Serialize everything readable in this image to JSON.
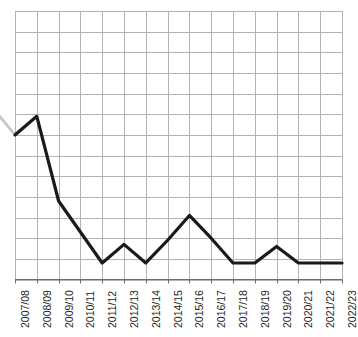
{
  "chart_data": {
    "type": "line",
    "title": "",
    "subtitle": "",
    "xlabel": "",
    "ylabel": "",
    "categories": [
      "2007/08",
      "2008/09",
      "2009/10",
      "2010/11",
      "2011/12",
      "2012/13",
      "2013/14",
      "2014/15",
      "2015/16",
      "2016/17",
      "2017/18",
      "2018/19",
      "2019/20",
      "2020/21",
      "2021/22",
      "2022/23"
    ],
    "series": [
      {
        "name": "series-1",
        "color": "#1a1a1a",
        "values": [
          7.0,
          7.9,
          3.8,
          2.3,
          0.8,
          1.7,
          0.8,
          1.9,
          3.1,
          2.0,
          0.8,
          0.8,
          1.6,
          0.8,
          0.8,
          0.8
        ]
      }
    ],
    "lead_in_segment": {
      "name": "prior-period-extension",
      "color": "#c8c8c8",
      "from": {
        "x": -0.7,
        "y": 7.9
      },
      "to": {
        "x": 0,
        "y": 7.0
      }
    },
    "ylim": [
      0,
      13
    ],
    "xlim": [
      0,
      15
    ],
    "grid": true,
    "grid_color": "#b3b3b3",
    "grid_columns": 15,
    "grid_rows": 13,
    "axis_color": "#6e6e6e",
    "legend": "none",
    "annotations": []
  },
  "axes": {
    "x_axis_name": "year-axis",
    "tick_labels_rotation": "-90deg"
  }
}
